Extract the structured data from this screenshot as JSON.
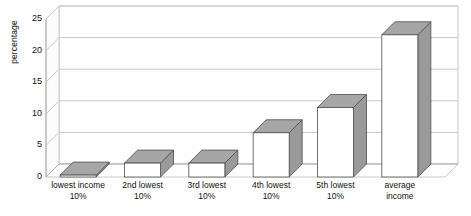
{
  "chart_data": {
    "type": "bar",
    "title": "",
    "subtitle": "",
    "xlabel": "",
    "ylabel": "percentage",
    "ylim": [
      0,
      25
    ],
    "ytick_step": 5,
    "yticks": [
      "0",
      "5",
      "10",
      "15",
      "20",
      "25"
    ],
    "grid": true,
    "legend": null,
    "style": "3d-column",
    "categories": [
      "lowest income 10%",
      "2nd lowest 10%",
      "3rd lowest 10%",
      "4th lowest 10%",
      "5th lowest 10%",
      "average income"
    ],
    "category_lines": [
      [
        "lowest income",
        "10%"
      ],
      [
        "2nd lowest",
        "10%"
      ],
      [
        "3rd lowest",
        "10%"
      ],
      [
        "4th lowest",
        "10%"
      ],
      [
        "5th lowest",
        "10%"
      ],
      [
        "average",
        "income"
      ]
    ],
    "values": [
      0.3,
      2.2,
      2.2,
      7.0,
      11.0,
      22.5
    ],
    "series": [
      {
        "name": "percentage",
        "values": [
          0.3,
          2.2,
          2.2,
          7.0,
          11.0,
          22.5
        ]
      }
    ]
  },
  "colors": {
    "bar_front": "#ffffff",
    "bar_side": "#9a9a9a",
    "bar_top": "#a6a6a6",
    "bar_outline": "#4d4d4d",
    "gridline": "#c8c8c8",
    "axis": "#b0b0b0",
    "text": "#111111",
    "background": "#ffffff"
  }
}
